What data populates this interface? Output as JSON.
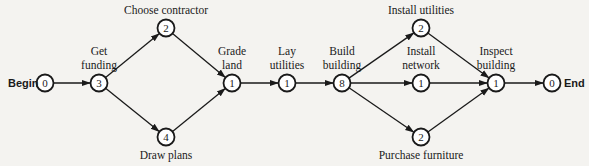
{
  "diagram": {
    "type": "activity-network",
    "colors": {
      "stroke": "#1a1a1a",
      "background": "#f4f3f0",
      "node_fill": "#ffffff"
    },
    "terminals": {
      "begin": "Begin",
      "end": "End"
    },
    "nodes": [
      {
        "id": "begin",
        "value": "0",
        "label": [],
        "x": 45,
        "y": 83
      },
      {
        "id": "get-funding",
        "value": "3",
        "label": [
          "Get",
          "funding"
        ],
        "x": 99,
        "y": 83
      },
      {
        "id": "choose-contractor",
        "value": "2",
        "label": [
          "Choose contractor"
        ],
        "x": 166,
        "y": 28
      },
      {
        "id": "draw-plans",
        "value": "4",
        "label": [
          "Draw plans"
        ],
        "x": 166,
        "y": 137
      },
      {
        "id": "grade-land",
        "value": "1",
        "label": [
          "Grade",
          "land"
        ],
        "x": 232,
        "y": 83
      },
      {
        "id": "lay-utilities",
        "value": "1",
        "label": [
          "Lay",
          "utilities"
        ],
        "x": 287,
        "y": 83
      },
      {
        "id": "build-building",
        "value": "8",
        "label": [
          "Build",
          "building"
        ],
        "x": 342,
        "y": 83
      },
      {
        "id": "install-utilities",
        "value": "2",
        "label": [
          "Install utilities"
        ],
        "x": 421,
        "y": 28
      },
      {
        "id": "install-network",
        "value": "1",
        "label": [
          "Install",
          "network"
        ],
        "x": 421,
        "y": 83
      },
      {
        "id": "purchase-furniture",
        "value": "2",
        "label": [
          "Purchase furniture"
        ],
        "x": 421,
        "y": 137
      },
      {
        "id": "inspect-building",
        "value": "1",
        "label": [
          "Inspect",
          "building"
        ],
        "x": 496,
        "y": 83
      },
      {
        "id": "end",
        "value": "0",
        "label": [],
        "x": 552,
        "y": 83
      }
    ],
    "edges": [
      [
        "begin",
        "get-funding"
      ],
      [
        "get-funding",
        "choose-contractor"
      ],
      [
        "get-funding",
        "draw-plans"
      ],
      [
        "choose-contractor",
        "grade-land"
      ],
      [
        "draw-plans",
        "grade-land"
      ],
      [
        "grade-land",
        "lay-utilities"
      ],
      [
        "lay-utilities",
        "build-building"
      ],
      [
        "build-building",
        "install-utilities"
      ],
      [
        "build-building",
        "install-network"
      ],
      [
        "build-building",
        "purchase-furniture"
      ],
      [
        "install-utilities",
        "inspect-building"
      ],
      [
        "install-network",
        "inspect-building"
      ],
      [
        "purchase-furniture",
        "inspect-building"
      ],
      [
        "inspect-building",
        "end"
      ]
    ]
  }
}
